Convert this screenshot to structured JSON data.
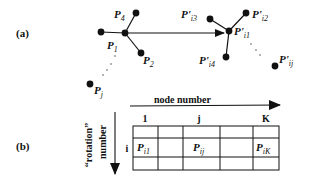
{
  "panel_a": {
    "label": "(a)",
    "left_cluster": {
      "center": {
        "name": "P",
        "sub": "1"
      },
      "neighbors": [
        {
          "name": "P",
          "sub": "2"
        },
        {
          "name": "P",
          "sub": "3"
        },
        {
          "name": "P",
          "sub": "4"
        }
      ],
      "distant": {
        "name": "P",
        "sub": "j"
      }
    },
    "right_cluster": {
      "center": {
        "name": "P'",
        "sub": "i1"
      },
      "neighbors": [
        {
          "name": "P'",
          "sub": "i2"
        },
        {
          "name": "P'",
          "sub": "i3"
        },
        {
          "name": "P'",
          "sub": "i4"
        }
      ],
      "distant": {
        "name": "P'",
        "sub": "ij"
      }
    }
  },
  "panel_b": {
    "label": "(b)",
    "x_axis_label": "node number",
    "y_axis_label_line1": "“rotation”",
    "y_axis_label_line2": "number",
    "column_headers": [
      "1",
      "",
      "j",
      "",
      "K"
    ],
    "row_header": "i",
    "cells": [
      [
        {
          "name": "",
          "sub": ""
        },
        {
          "name": "",
          "sub": ""
        },
        {
          "name": "",
          "sub": ""
        },
        {
          "name": "",
          "sub": ""
        },
        {
          "name": "",
          "sub": ""
        }
      ],
      [
        {
          "name": "P",
          "sub": "i1"
        },
        {
          "name": "",
          "sub": ""
        },
        {
          "name": "P",
          "sub": "ij"
        },
        {
          "name": "",
          "sub": ""
        },
        {
          "name": "P",
          "sub": "iK"
        }
      ],
      [
        {
          "name": "",
          "sub": ""
        },
        {
          "name": "",
          "sub": ""
        },
        {
          "name": "",
          "sub": ""
        },
        {
          "name": "",
          "sub": ""
        },
        {
          "name": "",
          "sub": ""
        }
      ]
    ]
  }
}
